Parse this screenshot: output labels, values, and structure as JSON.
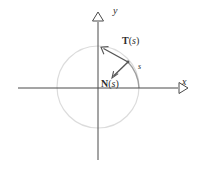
{
  "figure": {
    "background_color": "#ffffff",
    "width": 199,
    "height": 178
  },
  "colors": {
    "axis": "#4a4a4a",
    "circle_light": "#d8d8d8",
    "arc_highlight": "#9a9a9a",
    "vector": "#555555",
    "text": "#2b2b2b"
  },
  "axes": {
    "x_label": "x",
    "y_label": "y",
    "origin": {
      "x": 98,
      "y": 88
    },
    "x_arrow_marker": "open-triangle-right",
    "y_arrow_marker": "open-triangle-up"
  },
  "curve": {
    "name": "circle",
    "center": {
      "x": 98,
      "y": 87
    },
    "radius": 41,
    "arc_label": "s",
    "arc_start_angle_deg": 0,
    "arc_end_angle_deg": 38
  },
  "vectors": [
    {
      "id": "tangent",
      "name_bold": "T",
      "open_paren": "(",
      "arg": "s",
      "close_paren": ")",
      "label": "T(s)",
      "base": {
        "x": 128,
        "y": 62
      },
      "tip": {
        "x": 101,
        "y": 47
      },
      "arrow_marker": "open-arrowhead"
    },
    {
      "id": "normal",
      "name_bold": "N",
      "open_paren": "(",
      "arg": "s",
      "close_paren": ")",
      "label": "N(s)",
      "base": {
        "x": 128,
        "y": 62
      },
      "tip": {
        "x": 112,
        "y": 78
      },
      "arrow_marker": "open-arrowhead"
    }
  ]
}
